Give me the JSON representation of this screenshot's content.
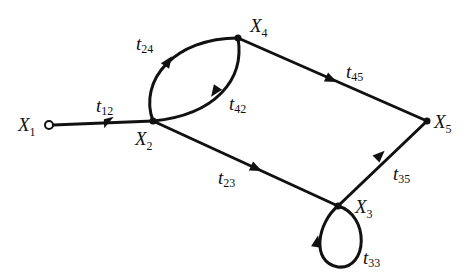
{
  "diagram": {
    "type": "signal-flow-graph",
    "colors": {
      "ink": "#111111",
      "background": "#ffffff"
    },
    "nodes": [
      {
        "id": "X1",
        "name": "X",
        "sub": "1",
        "x": 49,
        "y": 125,
        "style": "open"
      },
      {
        "id": "X2",
        "name": "X",
        "sub": "2",
        "x": 153,
        "y": 121,
        "style": "filled"
      },
      {
        "id": "X3",
        "name": "X",
        "sub": "3",
        "x": 338,
        "y": 206,
        "style": "filled"
      },
      {
        "id": "X4",
        "name": "X",
        "sub": "4",
        "x": 238,
        "y": 38,
        "style": "filled"
      },
      {
        "id": "X5",
        "name": "X",
        "sub": "5",
        "x": 427,
        "y": 121,
        "style": "filled"
      }
    ],
    "edges": [
      {
        "id": "t12",
        "from": "X1",
        "to": "X2",
        "label": "t",
        "sub": "12"
      },
      {
        "id": "t24",
        "from": "X2",
        "to": "X4",
        "label": "t",
        "sub": "24"
      },
      {
        "id": "t42",
        "from": "X4",
        "to": "X2",
        "label": "t",
        "sub": "42"
      },
      {
        "id": "t45",
        "from": "X4",
        "to": "X5",
        "label": "t",
        "sub": "45"
      },
      {
        "id": "t23",
        "from": "X2",
        "to": "X3",
        "label": "t",
        "sub": "23"
      },
      {
        "id": "t35",
        "from": "X3",
        "to": "X5",
        "label": "t",
        "sub": "35"
      },
      {
        "id": "t33",
        "from": "X3",
        "to": "X3",
        "label": "t",
        "sub": "33"
      }
    ]
  }
}
